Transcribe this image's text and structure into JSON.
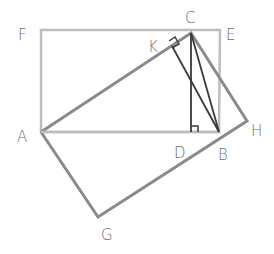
{
  "diagram": {
    "title": "",
    "colors": {
      "rectangle": "#bdbdbd",
      "square_outline": "#8a8a8a",
      "inner_lines": "#3a3a3a",
      "label": "#6e6e6e"
    },
    "points": {
      "F": {
        "x": 41,
        "y": 30
      },
      "E": {
        "x": 220,
        "y": 30
      },
      "A": {
        "x": 41,
        "y": 132
      },
      "B": {
        "x": 219,
        "y": 132
      },
      "C": {
        "x": 191,
        "y": 33
      },
      "K": {
        "x": 172,
        "y": 46
      },
      "D": {
        "x": 191,
        "y": 132
      },
      "H": {
        "x": 247,
        "y": 121
      },
      "G": {
        "x": 98,
        "y": 217
      }
    },
    "labels": [
      {
        "text": "F",
        "x": 18,
        "y": 40
      },
      {
        "text": "C",
        "x": 185,
        "y": 23
      },
      {
        "text": "E",
        "x": 226,
        "y": 40
      },
      {
        "text": "K",
        "x": 148,
        "y": 52
      },
      {
        "text": "A",
        "x": 17,
        "y": 142
      },
      {
        "text": "D",
        "x": 174,
        "y": 158
      },
      {
        "text": "B",
        "x": 218,
        "y": 160
      },
      {
        "text": "H",
        "x": 251,
        "y": 136
      },
      {
        "text": "G",
        "x": 101,
        "y": 240
      }
    ]
  }
}
